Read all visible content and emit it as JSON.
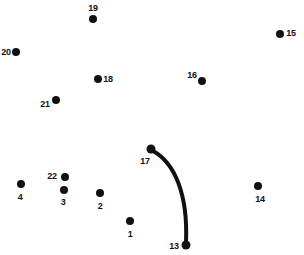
{
  "puzzle": {
    "type": "connect-the-dots",
    "width": 304,
    "height": 255,
    "background_color": "#ffffff",
    "dot_color": "#111111",
    "label_color": "#111111",
    "line_color": "#111111",
    "line_width": 4,
    "dots": [
      {
        "label": "1",
        "x": 130,
        "y": 221,
        "r": 4.0,
        "lx": 130,
        "ly": 234
      },
      {
        "label": "2",
        "x": 100,
        "y": 193,
        "r": 4.0,
        "lx": 100,
        "ly": 206
      },
      {
        "label": "3",
        "x": 64,
        "y": 190,
        "r": 4.0,
        "lx": 63,
        "ly": 202
      },
      {
        "label": "4",
        "x": 21,
        "y": 184,
        "r": 4.0,
        "lx": 20,
        "ly": 197
      },
      {
        "label": "13",
        "x": 186,
        "y": 245,
        "r": 4.5,
        "lx": 174,
        "ly": 246
      },
      {
        "label": "14",
        "x": 258,
        "y": 186,
        "r": 4.0,
        "lx": 260,
        "ly": 199
      },
      {
        "label": "15",
        "x": 280,
        "y": 34,
        "r": 4.0,
        "lx": 291,
        "ly": 33
      },
      {
        "label": "16",
        "x": 202,
        "y": 81,
        "r": 4.0,
        "lx": 192,
        "ly": 75
      },
      {
        "label": "17",
        "x": 151,
        "y": 149,
        "r": 4.5,
        "lx": 145,
        "ly": 161
      },
      {
        "label": "18",
        "x": 98,
        "y": 79,
        "r": 4.0,
        "lx": 108,
        "ly": 79
      },
      {
        "label": "19",
        "x": 93,
        "y": 19,
        "r": 4.0,
        "lx": 93,
        "ly": 8
      },
      {
        "label": "20",
        "x": 16,
        "y": 52,
        "r": 4.0,
        "lx": 6,
        "ly": 52
      },
      {
        "label": "21",
        "x": 56,
        "y": 100,
        "r": 4.0,
        "lx": 45,
        "ly": 104
      },
      {
        "label": "22",
        "x": 65,
        "y": 177,
        "r": 4.0,
        "lx": 52,
        "ly": 176
      }
    ],
    "connections": [
      {
        "name": "curve-17-to-13",
        "from": "17",
        "to": "13",
        "path": "M 153 151 C 175 163, 188 195, 186 242"
      }
    ]
  }
}
